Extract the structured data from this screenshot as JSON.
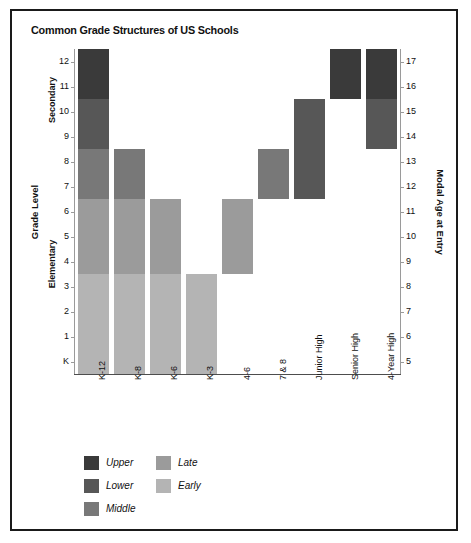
{
  "figure": {
    "title": "Common Grade Structures of US Schools",
    "background": "#ffffff",
    "border_color": "#1a1a1a"
  },
  "chart_data": {
    "type": "bar",
    "subtype": "stacked-range-bar",
    "title": "Common Grade Structures of US Schools",
    "xlabel": "",
    "ylabel": "Grade Level",
    "y2label": "Modal Age at Entry",
    "grid": false,
    "legend_position": "below-plot-left",
    "categories": [
      "K-12",
      "K-8",
      "K-6",
      "K-3",
      "4-6",
      "7 & 8",
      "Junior High",
      "Senior High",
      "4-Year High"
    ],
    "y_axis": {
      "label": "Grade Level",
      "tick_labels": [
        "K",
        "1",
        "2",
        "3",
        "4",
        "5",
        "6",
        "7",
        "8",
        "9",
        "10",
        "11",
        "12"
      ],
      "tick_values": [
        0,
        1,
        2,
        3,
        4,
        5,
        6,
        7,
        8,
        9,
        10,
        11,
        12
      ],
      "ylim": [
        -0.5,
        12.5
      ],
      "group_labels": [
        "Elementary",
        "Secondary"
      ]
    },
    "y2_axis": {
      "label": "Modal Age at Entry",
      "tick_labels": [
        "5",
        "6",
        "7",
        "8",
        "9",
        "10",
        "11",
        "12",
        "13",
        "14",
        "15",
        "16",
        "17"
      ],
      "tick_values": [
        5,
        6,
        7,
        8,
        9,
        10,
        11,
        12,
        13,
        14,
        15,
        16,
        17
      ],
      "ylim": [
        4.5,
        17.5
      ]
    },
    "series": [
      {
        "name": "Upper",
        "color": "#3a3a3a",
        "grade_range": [
          11,
          12
        ]
      },
      {
        "name": "Lower",
        "color": "#575757",
        "grade_range": [
          9,
          10
        ]
      },
      {
        "name": "Middle",
        "color": "#787878",
        "grade_range": [
          7,
          8
        ]
      },
      {
        "name": "Late",
        "color": "#9b9b9b",
        "grade_range": [
          4,
          6
        ]
      },
      {
        "name": "Early",
        "color": "#b4b4b4",
        "grade_range": [
          0,
          3
        ]
      }
    ],
    "bars": [
      {
        "category": "K-12",
        "grade_span": [
          0,
          12
        ],
        "bands": [
          {
            "level": "Early",
            "from": 0,
            "to": 3
          },
          {
            "level": "Late",
            "from": 4,
            "to": 6
          },
          {
            "level": "Middle",
            "from": 7,
            "to": 8
          },
          {
            "level": "Lower",
            "from": 9,
            "to": 10
          },
          {
            "level": "Upper",
            "from": 11,
            "to": 12
          }
        ]
      },
      {
        "category": "K-8",
        "grade_span": [
          0,
          8
        ],
        "bands": [
          {
            "level": "Early",
            "from": 0,
            "to": 3
          },
          {
            "level": "Late",
            "from": 4,
            "to": 6
          },
          {
            "level": "Middle",
            "from": 7,
            "to": 8
          }
        ]
      },
      {
        "category": "K-6",
        "grade_span": [
          0,
          6
        ],
        "bands": [
          {
            "level": "Early",
            "from": 0,
            "to": 3
          },
          {
            "level": "Late",
            "from": 4,
            "to": 6
          }
        ]
      },
      {
        "category": "K-3",
        "grade_span": [
          0,
          3
        ],
        "bands": [
          {
            "level": "Early",
            "from": 0,
            "to": 3
          }
        ]
      },
      {
        "category": "4-6",
        "grade_span": [
          4,
          6
        ],
        "bands": [
          {
            "level": "Late",
            "from": 4,
            "to": 6
          }
        ]
      },
      {
        "category": "7 & 8",
        "grade_span": [
          7,
          8
        ],
        "bands": [
          {
            "level": "Middle",
            "from": 7,
            "to": 8
          }
        ]
      },
      {
        "category": "Junior High",
        "grade_span": [
          7,
          10
        ],
        "bands": [
          {
            "level": "Lower",
            "from": 7,
            "to": 10
          }
        ]
      },
      {
        "category": "Senior High",
        "grade_span": [
          11,
          12
        ],
        "bands": [
          {
            "level": "Upper",
            "from": 11,
            "to": 12
          }
        ]
      },
      {
        "category": "4-Year High",
        "grade_span": [
          9,
          12
        ],
        "bands": [
          {
            "level": "Lower",
            "from": 9,
            "to": 10
          },
          {
            "level": "Upper",
            "from": 11,
            "to": 12
          }
        ]
      }
    ],
    "legend": {
      "entries": [
        {
          "label": "Upper",
          "color": "#3a3a3a"
        },
        {
          "label": "Lower",
          "color": "#575757"
        },
        {
          "label": "Middle",
          "color": "#787878"
        },
        {
          "label": "Late",
          "color": "#9b9b9b"
        },
        {
          "label": "Early",
          "color": "#b4b4b4"
        }
      ]
    }
  }
}
